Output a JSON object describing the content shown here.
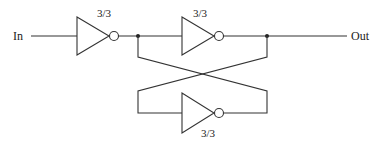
{
  "diagram": {
    "type": "logic-circuit",
    "input_label": "In",
    "output_label": "Out",
    "gates": [
      {
        "id": "inv1",
        "kind": "inverter",
        "size_label": "3/3"
      },
      {
        "id": "inv2",
        "kind": "inverter",
        "size_label": "3/3"
      },
      {
        "id": "inv3",
        "kind": "inverter",
        "size_label": "3/3",
        "position": "feedback"
      }
    ],
    "colors": {
      "line": "#333333",
      "background": "#ffffff"
    }
  }
}
